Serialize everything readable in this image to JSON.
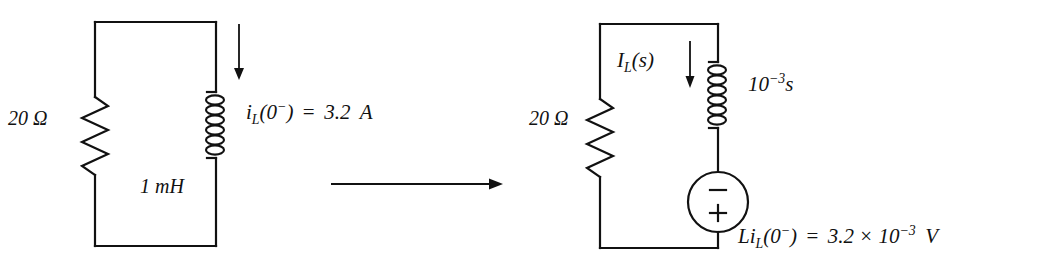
{
  "figure": {
    "type": "circuit-transformation-diagram",
    "transform_arrow": "arrow-right"
  },
  "colors": {
    "stroke": "#111111",
    "background": "#ffffff"
  },
  "left_circuit": {
    "name": "time-domain-circuit",
    "resistor_label": "20 Ω",
    "resistor_value": "20",
    "resistor_unit": "Ω",
    "inductor_label": "1 mH",
    "inductor_value": "1",
    "inductor_unit": "mH",
    "current_arrow": "downward-current-arrow",
    "current_label": {
      "symbol": "i",
      "subscript": "L",
      "argument": "(0",
      "superscript": "−",
      "argument_close": ")",
      "equals": "=",
      "value": "3.2",
      "unit": "A",
      "full": "i_L(0−) = 3.2 A"
    }
  },
  "right_circuit": {
    "name": "s-domain-circuit",
    "resistor_label": "20 Ω",
    "resistor_value": "20",
    "resistor_unit": "Ω",
    "inductor_impedance": {
      "mantissa": "10",
      "exponent": "−3",
      "variable": "s",
      "full": "10^-3 s"
    },
    "current_label": {
      "symbol": "I",
      "subscript": "L",
      "argument": "(s)",
      "full": "I_L(s)"
    },
    "current_arrow": "downward-current-arrow",
    "source": {
      "name": "voltage-source",
      "top_terminal": "−",
      "bottom_terminal": "+",
      "label": {
        "symbol": "Li",
        "subscript": "L",
        "argument": "(0",
        "superscript": "−",
        "argument_close": ")",
        "equals": "=",
        "mantissa": "3.2",
        "times": "×",
        "power_base": "10",
        "power_exp": "−3",
        "unit": "V",
        "full": "Li_L(0−) = 3.2 × 10^-3 V"
      }
    }
  }
}
